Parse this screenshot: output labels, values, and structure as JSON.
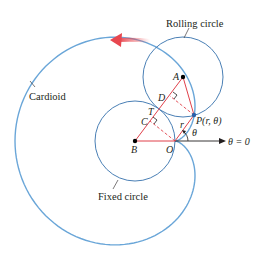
{
  "figure": {
    "type": "cardioid construction",
    "labels": {
      "rolling_circle": "Rolling circle",
      "fixed_circle": "Fixed circle",
      "cardioid": "Cardioid",
      "point_A": "A",
      "point_B": "B",
      "point_C": "C",
      "point_D": "D",
      "point_T": "T",
      "point_O": "O",
      "point_P": "P(r, θ)",
      "radius_r": "r",
      "angle_theta": "θ",
      "polar_axis": "θ = 0"
    },
    "colors": {
      "curve": "#5b9bd5",
      "circle": "#4a7fb5",
      "segment": "#e0404a",
      "arrow": "#e8474f",
      "axis": "#231f20"
    },
    "geometry": {
      "fixed_circle": {
        "cx": 135,
        "cy": 141,
        "r": 40
      },
      "rolling_circle": {
        "cx": 183,
        "cy": 77,
        "r": 40
      },
      "origin": {
        "x": 175,
        "y": 141
      },
      "point_P": {
        "x": 194,
        "y": 115
      }
    }
  }
}
